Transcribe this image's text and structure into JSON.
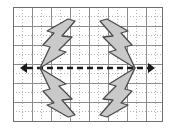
{
  "figure": {
    "canvas": {
      "width": 175,
      "height": 135,
      "background": "#ffffff"
    }
  },
  "colors": {
    "background": "#ffffff",
    "grid_major": "#8c8c8c",
    "grid_minor": "#b4b4b4",
    "grid_border": "#6e6e6e",
    "axis": "#1a1a1a",
    "bolt_fill": "#c9c9c9",
    "bolt_stroke": "#4a4a4a"
  },
  "grid": {
    "x": 13,
    "y": 7,
    "width": 150,
    "height": 115,
    "cell_size": 19,
    "minor_divisions": 2,
    "major_line_width": 1,
    "minor_line_style": "dotted",
    "columns": 8,
    "rows": 6,
    "border_visible": true
  },
  "axis": {
    "name": "horizontal-axis",
    "y": 68,
    "x_start": 20,
    "x_end": 155,
    "stroke_width": 2.6,
    "dash_pattern": "6 4",
    "arrow_left": true,
    "arrow_right": true,
    "arrow_size": 7,
    "label": ""
  },
  "vertices": {
    "left": {
      "x": 40,
      "y": 68
    },
    "right": {
      "x": 135,
      "y": 68
    }
  },
  "shapes": [
    {
      "name": "bolt-upper-left",
      "quadrant": "upper-left",
      "orientation": "points down-left toward left vertex",
      "fill": "#c9c9c9",
      "stroke": "#4a4a4a",
      "stroke_width": 1.3,
      "points": "68,19 75,21 62,36 72,37 59,50 66,52 40,68 50,47 43,45 54,33 47,31"
    },
    {
      "name": "bolt-upper-right",
      "quadrant": "upper-right",
      "orientation": "points down-right toward right vertex",
      "fill": "#c9c9c9",
      "stroke": "#4a4a4a",
      "stroke_width": 1.3,
      "points": "107,19 100,21 113,36 103,37 116,50 109,52 135,68 125,47 132,45 121,33 128,31"
    },
    {
      "name": "bolt-lower-left",
      "quadrant": "lower-left",
      "orientation": "points up-left toward left vertex",
      "fill": "#c9c9c9",
      "stroke": "#4a4a4a",
      "stroke_width": 1.3,
      "points": "68,117 75,115 62,100 72,99 59,86 66,84 40,68 50,89 43,91 54,103 47,105"
    },
    {
      "name": "bolt-lower-right",
      "quadrant": "lower-right",
      "orientation": "points up-right toward right vertex",
      "fill": "#c9c9c9",
      "stroke": "#4a4a4a",
      "stroke_width": 1.3,
      "points": "107,117 100,115 113,100 103,99 116,86 109,84 135,68 125,89 132,91 121,103 128,105"
    }
  ],
  "labels": {
    "caption": ""
  }
}
